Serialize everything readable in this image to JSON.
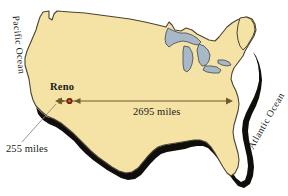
{
  "figure": {
    "type": "map",
    "width": 288,
    "height": 196,
    "background_color": "#ffffff"
  },
  "colors": {
    "land_fill": "#f5e3a6",
    "land_outline": "#4a4434",
    "lake_fill": "#a9b8c6",
    "lake_outline": "#4a5560",
    "shadow": "#100e0a",
    "arrow": "#6b5a2a",
    "city_marker_ring": "#7a1c12",
    "city_marker_center": "#c0764a",
    "leader_line": "#8a8a80",
    "text": "#1a1a18"
  },
  "labels": {
    "city": "Reno",
    "coast_to_coast_distance": "2695 miles",
    "reno_to_coast_distance": "255 miles",
    "ocean_west": "Pacific Ocean",
    "ocean_east": "Atlantic Ocean"
  },
  "markers": [
    {
      "name": "Reno",
      "x": 69,
      "y": 99
    }
  ],
  "measurements": [
    {
      "name": "coast-to-coast",
      "label": "2695 miles",
      "from_x": 56,
      "to_x": 232,
      "y": 101
    },
    {
      "name": "reno-to-west-coast",
      "label": "255 miles",
      "from_x": 56,
      "to_x": 64,
      "y": 101
    }
  ]
}
